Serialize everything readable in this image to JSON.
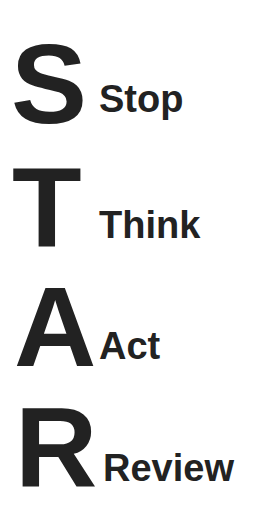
{
  "acronym": "STAR",
  "items": [
    {
      "letter": "S",
      "word": "Stop"
    },
    {
      "letter": "T",
      "word": "Think"
    },
    {
      "letter": "A",
      "word": "Act"
    },
    {
      "letter": "R",
      "word": "Review"
    }
  ],
  "colors": {
    "text": "#222222",
    "background": "#ffffff"
  }
}
